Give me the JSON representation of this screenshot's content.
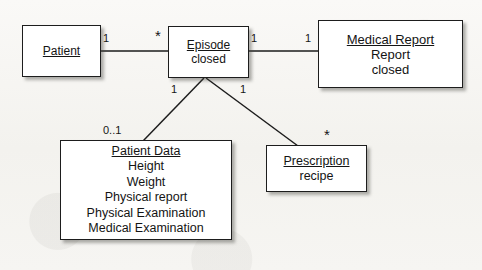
{
  "diagram": {
    "type": "uml-class-diagram",
    "background_color": "#f6f5f2",
    "line_color": "#1d1d1d",
    "node_fill": "#ffffff",
    "nodes": [
      {
        "id": "patient",
        "title": "Patient",
        "attributes": []
      },
      {
        "id": "episode",
        "title": "Episode",
        "attributes": [
          "closed"
        ]
      },
      {
        "id": "medical_report",
        "title": "Medical Report",
        "attributes": [
          "Report",
          "closed"
        ]
      },
      {
        "id": "patient_data",
        "title": "Patient Data",
        "attributes": [
          "Height",
          "Weight",
          "Physical report",
          "Physical Examination",
          "Medical Examination"
        ]
      },
      {
        "id": "prescription",
        "title": "Prescription",
        "attributes": [
          "recipe"
        ]
      }
    ],
    "multiplicities": [
      {
        "id": "patient_end",
        "label": "1"
      },
      {
        "id": "episode_left_end",
        "label": "*"
      },
      {
        "id": "episode_right_end",
        "label": "1"
      },
      {
        "id": "medical_report_end",
        "label": "1"
      },
      {
        "id": "episode_to_data_end",
        "label": "1"
      },
      {
        "id": "episode_to_prescription_end",
        "label": "1"
      },
      {
        "id": "patient_data_end",
        "label": "0..1"
      },
      {
        "id": "prescription_end",
        "label": "*"
      }
    ]
  }
}
